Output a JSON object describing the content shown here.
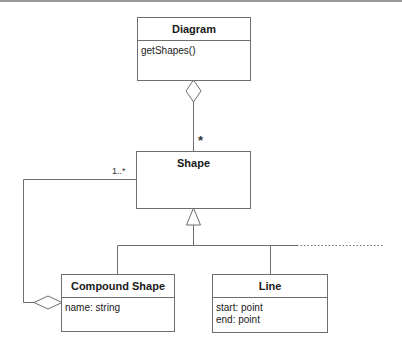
{
  "diagram": {
    "type": "UML class diagram",
    "classes": {
      "diagram": {
        "name": "Diagram",
        "operations": [
          "getShapes()"
        ]
      },
      "shape": {
        "name": "Shape"
      },
      "compound_shape": {
        "name": "Compound Shape",
        "attributes": [
          "name: string"
        ]
      },
      "line": {
        "name": "Line",
        "attributes": [
          "start: point",
          "end: point"
        ]
      }
    },
    "relationships": [
      {
        "kind": "aggregation",
        "whole": "Diagram",
        "part": "Shape",
        "multiplicity": "*"
      },
      {
        "kind": "aggregation",
        "whole": "Compound Shape",
        "part": "Shape",
        "multiplicity": "1..*"
      },
      {
        "kind": "generalization",
        "parent": "Shape",
        "children": [
          "Compound Shape",
          "Line",
          "..."
        ]
      }
    ],
    "multiplicities": {
      "diagram_shape": "*",
      "compound_shape": "1..*"
    },
    "colors": {
      "line": "#6e6e6e",
      "text": "#1a1a1a",
      "background": "#ffffff"
    }
  }
}
